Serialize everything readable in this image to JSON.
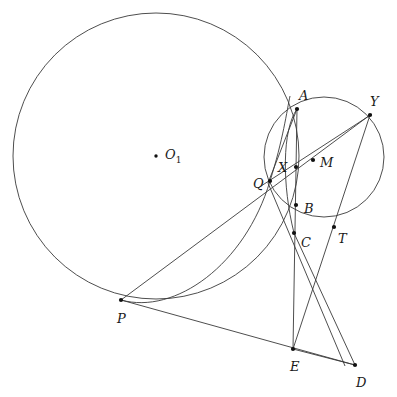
{
  "figure": {
    "background_color": "#ffffff",
    "stroke_color": "#3a3a3a",
    "point_color": "#111111",
    "width": 397,
    "height": 397
  },
  "labels": {
    "O1": "O",
    "O1_sub": "1",
    "A": "A",
    "B": "B",
    "C": "C",
    "D": "D",
    "E": "E",
    "M": "M",
    "P": "P",
    "Q": "Q",
    "T": "T",
    "X": "X",
    "Y": "Y"
  },
  "geometry": {
    "circles": [
      {
        "name": "large-circle",
        "cx": 156,
        "cy": 156,
        "r": 143
      },
      {
        "name": "small-circle",
        "cx": 324,
        "cy": 157,
        "r": 60
      }
    ],
    "arcs": [
      {
        "name": "arc-through-P-Q",
        "d": "M 121 300 C 175 315 245 265 270 181 C 283 140 287 110 290 96"
      },
      {
        "name": "arc-A-X-B-C",
        "d": "M 297 109 C 282 130 282 185 294 233"
      }
    ],
    "points": [
      {
        "name": "O1",
        "x": 156,
        "y": 156,
        "label_dx": 9,
        "label_dy": -8,
        "dot": true
      },
      {
        "name": "A",
        "x": 297,
        "y": 109,
        "label_dx": 2,
        "label_dy": -20,
        "dot": true
      },
      {
        "name": "Y",
        "x": 370,
        "y": 115,
        "label_dx": 0,
        "label_dy": -20,
        "dot": true
      },
      {
        "name": "X",
        "x": 296,
        "y": 167,
        "label_dx": -18,
        "label_dy": -6,
        "dot": true
      },
      {
        "name": "M",
        "x": 313,
        "y": 160,
        "label_dx": 7,
        "label_dy": -4,
        "dot": true
      },
      {
        "name": "Q",
        "x": 270,
        "y": 181,
        "label_dx": -17,
        "label_dy": -4,
        "dot": true
      },
      {
        "name": "B",
        "x": 296,
        "y": 205,
        "label_dx": 8,
        "label_dy": -3,
        "dot": true
      },
      {
        "name": "T",
        "x": 334,
        "y": 227,
        "label_dx": 4,
        "label_dy": 5,
        "dot": true
      },
      {
        "name": "C",
        "x": 294,
        "y": 233,
        "label_dx": 7,
        "label_dy": 3,
        "dot": true
      },
      {
        "name": "P",
        "x": 121,
        "y": 300,
        "label_dx": -4,
        "label_dy": 12,
        "dot": true
      },
      {
        "name": "E",
        "x": 293,
        "y": 349,
        "label_dx": -3,
        "label_dy": 11,
        "dot": true
      },
      {
        "name": "D",
        "x": 355,
        "y": 365,
        "label_dx": 1,
        "label_dy": 11,
        "dot": true
      }
    ],
    "segments": [
      {
        "name": "line-P-Y",
        "x1": 121,
        "y1": 300,
        "x2": 370,
        "y2": 115
      },
      {
        "name": "line-P-D",
        "x1": 121,
        "y1": 300,
        "x2": 355,
        "y2": 365
      },
      {
        "name": "line-A-E",
        "x1": 297,
        "y1": 109,
        "x2": 293,
        "y2": 349
      },
      {
        "name": "line-Y-E",
        "x1": 370,
        "y1": 115,
        "x2": 293,
        "y2": 349
      },
      {
        "name": "line-C-D",
        "x1": 294,
        "y1": 233,
        "x2": 355,
        "y2": 365
      },
      {
        "name": "line-E-D",
        "x1": 293,
        "y1": 349,
        "x2": 355,
        "y2": 365
      },
      {
        "name": "line-Q-Y",
        "x1": 258,
        "y1": 188,
        "x2": 372,
        "y2": 114
      },
      {
        "name": "line-A-Q-lower",
        "x1": 297,
        "y1": 109,
        "x2": 268,
        "y2": 183
      },
      {
        "name": "line-Q-T",
        "x1": 268,
        "y1": 183,
        "x2": 345,
        "y2": 366
      }
    ]
  }
}
